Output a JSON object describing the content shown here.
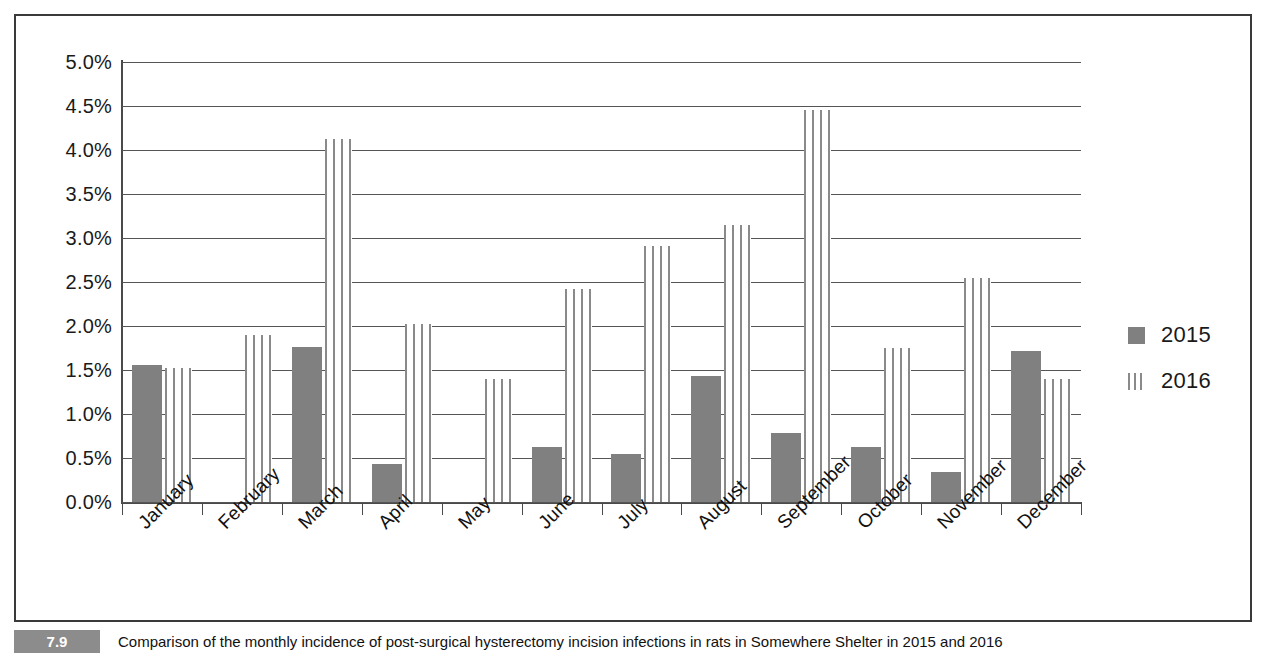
{
  "chart_data": {
    "type": "bar",
    "title": "",
    "xlabel": "",
    "ylabel": "",
    "ylim": [
      0,
      5
    ],
    "ytick_labels": [
      "5.0%",
      "4.5%",
      "4.0%",
      "3.5%",
      "3.0%",
      "2.5%",
      "2.0%",
      "1.5%",
      "1.0%",
      "0.5%",
      "0.0%"
    ],
    "ytick_values": [
      5.0,
      4.5,
      4.0,
      3.5,
      3.0,
      2.5,
      2.0,
      1.5,
      1.0,
      0.5,
      0.0
    ],
    "grid": true,
    "legend_position": "right",
    "categories": [
      "January",
      "February",
      "March",
      "April",
      "May",
      "June",
      "July",
      "August",
      "September",
      "October",
      "November",
      "December"
    ],
    "series": [
      {
        "name": "2015",
        "style": "solid",
        "color": "#808080",
        "values": [
          1.56,
          0.0,
          1.76,
          0.43,
          0.0,
          0.63,
          0.55,
          1.43,
          0.78,
          0.63,
          0.34,
          1.72
        ]
      },
      {
        "name": "2016",
        "style": "vertical-stripes",
        "color": "#8a8a8a",
        "values": [
          1.52,
          1.9,
          4.12,
          2.02,
          1.4,
          2.42,
          2.91,
          3.15,
          4.45,
          1.75,
          2.54,
          1.4
        ]
      }
    ]
  },
  "legend": {
    "items": [
      {
        "label": "2015",
        "swatch": "solid-square-icon"
      },
      {
        "label": "2016",
        "swatch": "striped-bars-icon"
      }
    ]
  },
  "caption": {
    "figure_number": "7.9",
    "text": "Comparison of the monthly incidence of post-surgical hysterectomy incision infections in rats in Somewhere Shelter in 2015 and 2016"
  },
  "colors": {
    "bar_2015": "#808080",
    "bar_2016": "#8a8a8a",
    "gridline": "#555555",
    "axis": "#4a4a4a",
    "frame": "#3a3a3a",
    "badge": "#8c8c8c"
  }
}
